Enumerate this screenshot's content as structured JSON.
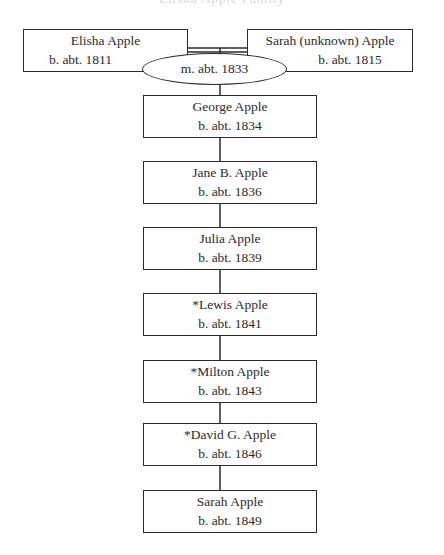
{
  "title": "Elisha Apple Family",
  "parents": [
    {
      "name": "Elisha Apple",
      "birth": "b. abt. 1811"
    },
    {
      "name": "Sarah (unknown) Apple",
      "birth": "b. abt. 1815"
    }
  ],
  "marriage": "m. abt. 1833",
  "children": [
    {
      "name": "George Apple",
      "birth": "b. abt. 1834"
    },
    {
      "name": "Jane B. Apple",
      "birth": "b. abt. 1836"
    },
    {
      "name": "Julia Apple",
      "birth": "b. abt. 1839"
    },
    {
      "name": "*Lewis Apple",
      "birth": "b. abt. 1841"
    },
    {
      "name": "*Milton Apple",
      "birth": "b. abt. 1843"
    },
    {
      "name": "*David G. Apple",
      "birth": "b. abt. 1846"
    },
    {
      "name": "Sarah Apple",
      "birth": "b. abt. 1849"
    }
  ]
}
